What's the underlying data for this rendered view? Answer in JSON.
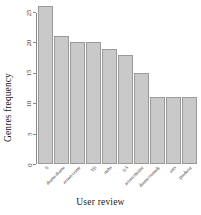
{
  "chart_data": {
    "type": "bar",
    "title": "",
    "xlabel": "User review",
    "ylabel": "Genres frequency",
    "categories": [
      "fi",
      "drama/drama",
      "action/crime",
      "TD",
      "mrbs",
      "2c5",
      "action/thriller",
      "drama/comedy",
      "ants",
      "producer"
    ],
    "values": [
      26,
      21,
      20,
      20,
      19,
      18,
      15,
      11,
      11,
      11
    ],
    "ylim": [
      0,
      26
    ],
    "yticks": [
      0,
      5,
      10,
      15,
      20,
      25
    ],
    "ytick_labels": [
      "0",
      "5",
      "10",
      "15",
      "20",
      "25"
    ],
    "grid": false,
    "legend": null,
    "bar_fill_color": "#c9c9c9",
    "bar_border_color": "#9a9a9a",
    "axis_color": "#8a8a8a",
    "text_color": "#1a1a1a"
  }
}
